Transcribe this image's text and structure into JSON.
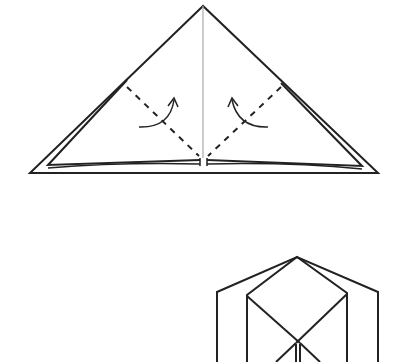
{
  "diagram": {
    "type": "origami-instructions",
    "steps": [
      {
        "name": "step-fold-triangle",
        "description": "Triangle with dashed valley-fold lines on both sides and curved arrows indicating folding the flaps upward toward the center",
        "elements": [
          "outer-triangle",
          "inner-triangle-layer",
          "center-crease",
          "left-dashed-fold-line",
          "right-dashed-fold-line",
          "left-fold-arrow",
          "right-fold-arrow"
        ]
      },
      {
        "name": "step-result-partial",
        "description": "Partially visible resulting shape: pentagonal outline with inner diamond and crossing lines, cropped at bottom",
        "elements": [
          "outer-pentagon",
          "inner-diamond",
          "crossing-lines"
        ]
      }
    ],
    "colors": {
      "line": "#222222",
      "crease": "#aaaaaa",
      "background": "#ffffff"
    }
  }
}
